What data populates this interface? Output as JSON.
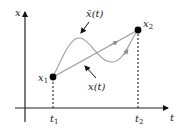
{
  "diagram": {
    "axes": {
      "x_label": "t",
      "y_label": "x"
    },
    "points": [
      {
        "label": "x",
        "sub": "1",
        "time_label": "t",
        "time_sub": "1"
      },
      {
        "label": "x",
        "sub": "2",
        "time_label": "t",
        "time_sub": "2"
      }
    ],
    "curves": {
      "perturbed_label": "x̄(t)",
      "straight_label": "x(t)"
    },
    "colors": {
      "axis": "#222222",
      "curve": "#9a9a9a",
      "point": "#000000"
    }
  }
}
